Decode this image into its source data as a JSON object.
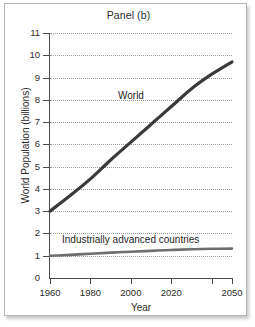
{
  "figure": {
    "title": "Panel (b)"
  },
  "chart_data": {
    "type": "line",
    "title": "Panel (b)",
    "xlabel": "Year",
    "ylabel": "World Population (billions)",
    "xlim": [
      1960,
      2050
    ],
    "ylim": [
      0,
      11
    ],
    "grid": true,
    "grid_axis": "y",
    "legend": "inline-labels",
    "x_ticks": [
      1960,
      1980,
      2000,
      2020,
      2040,
      2050
    ],
    "x_tick_labels": [
      "1960",
      "1980",
      "2000",
      "2020",
      "",
      "2050"
    ],
    "y_ticks": [
      0,
      1,
      2,
      3,
      4,
      5,
      6,
      7,
      8,
      9,
      10,
      11
    ],
    "y_tick_labels": [
      "0",
      "1",
      "2",
      "3",
      "4",
      "5",
      "6",
      "7",
      "8",
      "9",
      "10",
      "11"
    ],
    "x": [
      1960,
      1970,
      1980,
      1990,
      2000,
      2010,
      2020,
      2030,
      2040,
      2050
    ],
    "series": [
      {
        "name": "World",
        "label": "World",
        "color": "#3a3a3a",
        "values": [
          3.0,
          3.7,
          4.45,
          5.3,
          6.1,
          6.9,
          7.7,
          8.5,
          9.15,
          9.7
        ]
      },
      {
        "name": "Industrially advanced countries",
        "label": "Industrially advanced countries",
        "color": "#6e6e6e",
        "values": [
          1.0,
          1.04,
          1.09,
          1.14,
          1.18,
          1.22,
          1.26,
          1.29,
          1.31,
          1.32
        ]
      }
    ],
    "annotations": [
      {
        "text": "World",
        "x": 2003,
        "y": 8.35
      },
      {
        "text": "Industrially advanced countries",
        "x": 2005,
        "y": 1.95
      }
    ]
  },
  "colors": {
    "world_line": "#3a3a3a",
    "iac_line": "#6e6e6e",
    "axis": "#4a4a4a",
    "grid": "#9a9a9a",
    "text": "#2b2b2b",
    "frame": "#b6b6b6",
    "background": "#ffffff"
  }
}
